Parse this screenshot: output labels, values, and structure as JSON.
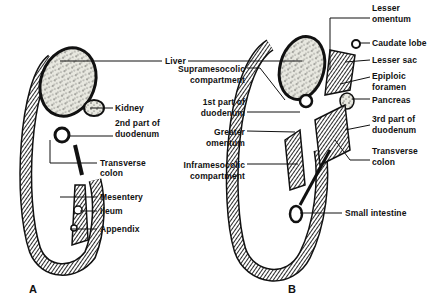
{
  "figure": {
    "panels": [
      {
        "id": "A",
        "letter": "A",
        "labels": {
          "liver": "Liver",
          "kidney": "Kidney",
          "duodenum2_l1": "2nd part of",
          "duodenum2_l2": "duodenum",
          "transverse_l1": "Transverse",
          "transverse_l2": "colon",
          "mesentery": "Mesentery",
          "ileum": "Ileum",
          "appendix": "Appendix"
        }
      },
      {
        "id": "B",
        "letter": "B",
        "labels": {
          "lesser_omentum_l1": "Lesser",
          "lesser_omentum_l2": "omentum",
          "caudate_lobe": "Caudate lobe",
          "lesser_sac": "Lesser sac",
          "epiploic_l1": "Epiploic",
          "epiploic_l2": "foramen",
          "pancreas": "Pancreas",
          "duodenum3_l1": "3rd part of",
          "duodenum3_l2": "duodenum",
          "transverse_l1": "Transverse",
          "transverse_l2": "colon",
          "small_intestine": "Small intestine",
          "supra_l1": "Supramesocolic",
          "supra_l2": "compartment",
          "duodenum1_l1": "1st part of",
          "duodenum1_l2": "duodenum",
          "greater_l1": "Greater",
          "greater_l2": "omentum",
          "infra_l1": "Inframesocolic",
          "infra_l2": "compartment"
        }
      }
    ]
  }
}
